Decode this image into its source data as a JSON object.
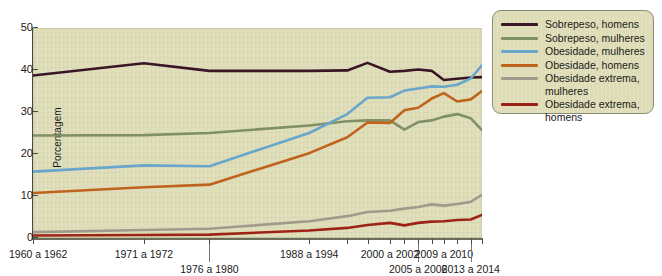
{
  "chart_data": {
    "type": "line",
    "title": "",
    "xlabel": "",
    "ylabel": "Porcentagem",
    "ylim": [
      0,
      50
    ],
    "yticks": [
      0,
      10,
      20,
      30,
      40,
      50
    ],
    "grid": false,
    "legend_position": "right",
    "x_categories": [
      "1960 a 1962",
      "1971 a 1972",
      "1976 a 1980",
      "1988 a 1994",
      "2000 a 2002",
      "2005 a 2006",
      "2009 a 2010",
      "2013 a 2014"
    ],
    "x_label_rows": [
      {
        "label": "1960 a 1962",
        "row": 1,
        "x_pct": 0.0
      },
      {
        "label": "1971 a 1972",
        "row": 1,
        "x_pct": 0.247
      },
      {
        "label": "1976 a 1980",
        "row": 2,
        "x_pct": 0.393
      },
      {
        "label": "1988 a 1994",
        "row": 1,
        "x_pct": 0.615
      },
      {
        "label": "2000 a 2002",
        "row": 1,
        "x_pct": 0.795
      },
      {
        "label": "2005 a 2006",
        "row": 2,
        "x_pct": 0.858
      },
      {
        "label": "2009 a 2010",
        "row": 1,
        "x_pct": 0.915
      },
      {
        "label": "2013 a 2014",
        "row": 2,
        "x_pct": 0.975
      }
    ],
    "series": [
      {
        "name": "Sobrepeso, homens",
        "color": "#3a1526",
        "x": [
          0.0,
          0.247,
          0.393,
          0.615,
          0.7,
          0.745,
          0.795,
          0.827,
          0.858,
          0.888,
          0.915,
          0.945,
          0.975,
          1.0
        ],
        "values": [
          38.7,
          41.6,
          39.8,
          39.8,
          39.9,
          41.7,
          39.6,
          39.8,
          40.1,
          39.8,
          37.6,
          37.9,
          38.2,
          38.3
        ]
      },
      {
        "name": "Sobrepeso, mulheres",
        "color": "#7f9067",
        "x": [
          0.0,
          0.247,
          0.393,
          0.615,
          0.7,
          0.745,
          0.795,
          0.827,
          0.858,
          0.888,
          0.915,
          0.945,
          0.975,
          1.0
        ],
        "values": [
          24.4,
          24.5,
          25.0,
          26.8,
          27.8,
          28.0,
          28.0,
          25.8,
          27.6,
          28.0,
          28.9,
          29.5,
          28.5,
          25.7
        ]
      },
      {
        "name": "Obesidade, mulheres",
        "color": "#6aa6cb",
        "x": [
          0.0,
          0.247,
          0.393,
          0.615,
          0.7,
          0.745,
          0.795,
          0.827,
          0.858,
          0.888,
          0.915,
          0.945,
          0.975,
          1.0
        ],
        "values": [
          15.8,
          17.3,
          17.1,
          25.0,
          29.5,
          33.4,
          33.5,
          35.1,
          35.6,
          36.1,
          36.0,
          36.5,
          38.0,
          41.1
        ]
      },
      {
        "name": "Obesidade, homens",
        "color": "#bf641d",
        "x": [
          0.0,
          0.247,
          0.393,
          0.615,
          0.7,
          0.745,
          0.795,
          0.827,
          0.858,
          0.888,
          0.915,
          0.945,
          0.975,
          1.0
        ],
        "values": [
          10.7,
          12.1,
          12.7,
          20.2,
          24.0,
          27.5,
          27.4,
          30.4,
          31.0,
          33.2,
          34.5,
          32.5,
          33.0,
          35.0
        ]
      },
      {
        "name": "Obesidade extrema, mulheres",
        "color": "#a09a8d",
        "x": [
          0.0,
          0.247,
          0.393,
          0.615,
          0.7,
          0.745,
          0.795,
          0.827,
          0.858,
          0.888,
          0.915,
          0.945,
          0.975,
          1.0
        ],
        "values": [
          1.4,
          1.9,
          2.2,
          4.0,
          5.2,
          6.2,
          6.5,
          7.0,
          7.4,
          8.0,
          7.7,
          8.1,
          8.6,
          10.3
        ]
      },
      {
        "name": "Obesidade extrema, homens",
        "color": "#9d2317",
        "x": [
          0.0,
          0.247,
          0.393,
          0.615,
          0.7,
          0.745,
          0.795,
          0.827,
          0.858,
          0.888,
          0.915,
          0.945,
          0.975,
          1.0
        ],
        "values": [
          0.6,
          0.7,
          0.8,
          1.8,
          2.4,
          3.1,
          3.6,
          3.0,
          3.6,
          3.9,
          4.0,
          4.3,
          4.4,
          5.5
        ]
      }
    ],
    "legend_entries": [
      {
        "label": "Sobrepeso, homens",
        "color": "#3a1526"
      },
      {
        "label": "Sobrepeso, mulheres",
        "color": "#7f9067"
      },
      {
        "label": "Obesidade, mulheres",
        "color": "#6aa6cb"
      },
      {
        "label": "Obesidade, homens",
        "color": "#bf641d"
      },
      {
        "label": "Obesidade extrema,",
        "label2": "mulheres",
        "color": "#a09a8d"
      },
      {
        "label": "Obesidade extrema,",
        "label2": "homens",
        "color": "#9d2317"
      }
    ],
    "xtick_positions": [
      0.0,
      0.247,
      0.393,
      0.615,
      0.7,
      0.745,
      0.795,
      0.827,
      0.858,
      0.888,
      0.915,
      0.945,
      0.975,
      1.0
    ],
    "colors": {
      "plot_background": "#dedcb6",
      "axis": "#4a4a43",
      "text": "#1a1a1a",
      "legend_border": "#8b8b74"
    }
  }
}
